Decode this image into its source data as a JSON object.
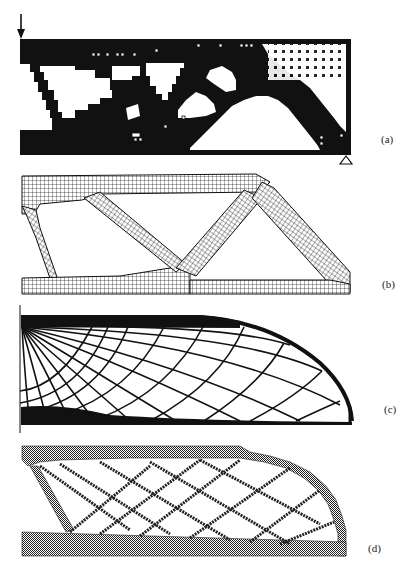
{
  "figure": {
    "panels": [
      {
        "id": "a",
        "label": "(a)",
        "description": "Pixelated topology optimization result with load arrow at top-left and roller support at bottom-right"
      },
      {
        "id": "b",
        "label": "(b)",
        "description": "Deformed quadrilateral finite-element mesh of optimized truss-like structure"
      },
      {
        "id": "c",
        "label": "(c)",
        "description": "Michell-type truss layout with radial and circular members meeting curved boundary"
      },
      {
        "id": "d",
        "label": "(d)",
        "description": "Checkerboard-textured pixelated topology with cross-braced Michell-like members"
      }
    ],
    "colors": {
      "ink": "#111111",
      "background": "#ffffff",
      "mesh": "#1a1a1a",
      "pixel_gray": "#3a3a3a"
    }
  }
}
